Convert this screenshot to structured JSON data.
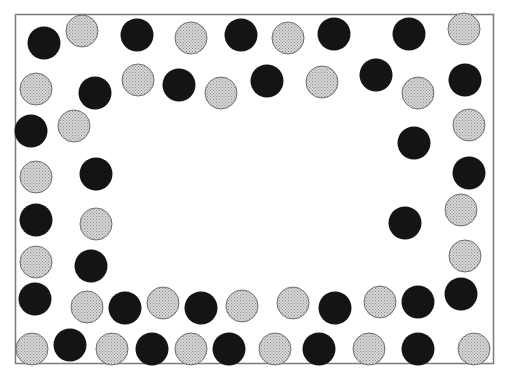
{
  "diagram": {
    "title": "",
    "colors": {
      "frame": "#7a7a7a",
      "black_fill": "#141414",
      "gray_fill": "#d8d8d8",
      "gray_dot": "#8c8c8c",
      "gray_stroke": "#6e6e6e",
      "background": "#ffffff"
    },
    "circle_kinds": [
      "black",
      "gray"
    ],
    "circles": [
      {
        "kind": "black"
      },
      {
        "kind": "gray"
      },
      {
        "kind": "black"
      },
      {
        "kind": "gray"
      },
      {
        "kind": "black"
      },
      {
        "kind": "gray"
      },
      {
        "kind": "black"
      },
      {
        "kind": "black"
      },
      {
        "kind": "gray"
      },
      {
        "kind": "gray"
      },
      {
        "kind": "black"
      },
      {
        "kind": "gray"
      },
      {
        "kind": "black"
      },
      {
        "kind": "gray"
      },
      {
        "kind": "black"
      },
      {
        "kind": "gray"
      },
      {
        "kind": "black"
      },
      {
        "kind": "gray"
      },
      {
        "kind": "black"
      },
      {
        "kind": "black"
      },
      {
        "kind": "gray"
      },
      {
        "kind": "black"
      },
      {
        "kind": "gray"
      },
      {
        "kind": "gray"
      },
      {
        "kind": "black"
      },
      {
        "kind": "black"
      },
      {
        "kind": "black"
      },
      {
        "kind": "gray"
      },
      {
        "kind": "black"
      },
      {
        "kind": "gray"
      },
      {
        "kind": "gray"
      },
      {
        "kind": "black"
      },
      {
        "kind": "gray"
      },
      {
        "kind": "black"
      },
      {
        "kind": "gray"
      },
      {
        "kind": "black"
      },
      {
        "kind": "gray"
      },
      {
        "kind": "black"
      },
      {
        "kind": "gray"
      },
      {
        "kind": "gray"
      },
      {
        "kind": "black"
      },
      {
        "kind": "gray"
      },
      {
        "kind": "black"
      },
      {
        "kind": "black"
      },
      {
        "kind": "gray"
      },
      {
        "kind": "black"
      },
      {
        "kind": "gray"
      },
      {
        "kind": "black"
      },
      {
        "kind": "gray"
      },
      {
        "kind": "black"
      },
      {
        "kind": "gray"
      },
      {
        "kind": "black"
      },
      {
        "kind": "gray"
      },
      {
        "kind": "black"
      },
      {
        "kind": "gray"
      }
    ],
    "counts": {
      "black": 27,
      "gray": 28,
      "total": 55
    }
  }
}
